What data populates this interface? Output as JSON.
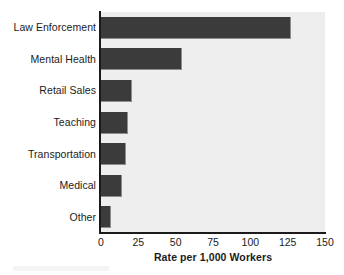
{
  "chart_data": {
    "type": "bar",
    "orientation": "horizontal",
    "title": "",
    "subtitle": "",
    "xlabel": "Rate per 1,000 Workers",
    "ylabel": "",
    "categories": [
      "Law Enforcement",
      "Mental Health",
      "Retail Sales",
      "Teaching",
      "Transportation",
      "Medical",
      "Other"
    ],
    "values": [
      127,
      54,
      21,
      18,
      17,
      14,
      7
    ],
    "xlim": [
      0,
      150
    ],
    "xticks": [
      0,
      25,
      50,
      75,
      100,
      125,
      150
    ],
    "xtick_labels": [
      "0",
      "25",
      "50",
      "75",
      "100",
      "125",
      "150"
    ],
    "grid": false,
    "legend": null,
    "bar_color": "#3b3b3b",
    "plot_background": "#eeeeee",
    "figure_background": "#ffffff",
    "axis_color": "#1b1b1b"
  }
}
